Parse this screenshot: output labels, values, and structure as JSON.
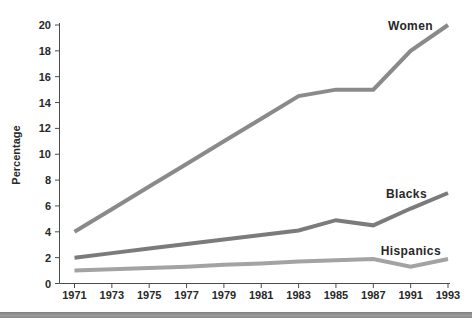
{
  "figure": {
    "ylabel": "Percentage"
  },
  "chart_data": {
    "type": "line",
    "title": "",
    "xlabel": "",
    "ylabel": "Percentage",
    "categories": [
      "1971",
      "1973",
      "1975",
      "1977",
      "1979",
      "1981",
      "1983",
      "1985",
      "1987",
      "1991",
      "1993"
    ],
    "yticks": [
      0,
      2,
      4,
      6,
      8,
      10,
      12,
      14,
      16,
      18,
      20
    ],
    "ylim": [
      0,
      20
    ],
    "grid": false,
    "legend_position": "end-of-line-labels",
    "series": [
      {
        "name": "Women",
        "color": "#8a8a8a",
        "values": [
          4,
          5.75,
          7.5,
          9.25,
          11,
          12.75,
          14.5,
          15,
          15,
          18,
          20
        ]
      },
      {
        "name": "Blacks",
        "color": "#7b7b7b",
        "values": [
          2,
          2.35,
          2.7,
          3.05,
          3.4,
          3.75,
          4.1,
          4.9,
          4.5,
          5.8,
          7
        ]
      },
      {
        "name": "Hispanics",
        "color": "#a3a3a3",
        "values": [
          1,
          1.1,
          1.2,
          1.3,
          1.45,
          1.55,
          1.7,
          1.8,
          1.9,
          1.3,
          1.9
        ]
      }
    ]
  },
  "colors": {
    "axis": "#4c4c4c",
    "text": "#282828",
    "background": "#ffffff",
    "bottom_bar": "#949494"
  }
}
